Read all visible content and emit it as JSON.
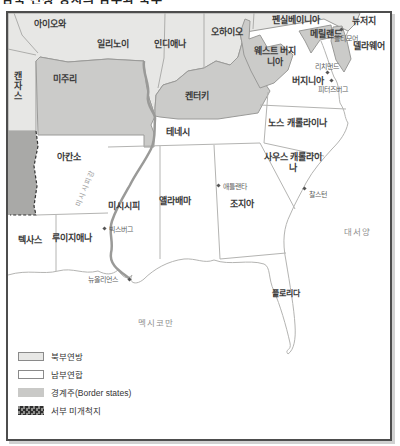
{
  "title_partial": "남북 전쟁 당시의 남부와 북부",
  "map": {
    "states": {
      "iowa": "아이오와",
      "illinois": "일리노이",
      "indiana": "인디애나",
      "ohio": "오하이오",
      "pennsylvania": "펜실베이니아",
      "new_jersey": "뉴저지",
      "kansas": "캔자스",
      "missouri": "미주리",
      "kentucky": "켄터키",
      "west_virginia": "웨스트 버지니아",
      "maryland": "메릴랜드",
      "delaware": "델라웨어",
      "virginia": "버지니아",
      "tennessee": "테네시",
      "north_carolina": "노스 캐롤라이나",
      "south_carolina": "사우스 캐롤라이나",
      "arkansas": "아칸소",
      "mississippi": "미시시피",
      "alabama": "앨라배마",
      "georgia": "조지아",
      "texas": "텍사스",
      "louisiana": "루이지애나",
      "florida": "플로리다"
    },
    "cities": {
      "baltimore": "볼티모어",
      "richmond": "리치먼드",
      "petersburg": "피터즈버그",
      "atlanta": "애틀랜타",
      "charleston": "찰스턴",
      "vicksburg": "빅스버그",
      "new_orleans": "뉴올리언스"
    },
    "water": {
      "atlantic": "대서양",
      "gulf_of_mexico": "멕시코만",
      "mississippi_river": "미시시피강"
    }
  },
  "legend": {
    "items": [
      {
        "label": "북부연방",
        "swatch": "union"
      },
      {
        "label": "남부연합",
        "swatch": "confederacy"
      },
      {
        "label": "경계주(Border states)",
        "swatch": "border-states"
      },
      {
        "label": "서부 미개척지",
        "swatch": "western-frontier"
      }
    ]
  },
  "colors": {
    "union": "#e7e7e5",
    "border_states": "#cbcbc9",
    "confederacy": "#ffffff",
    "western_frontier": "#a9a9a7",
    "boundary_line": "#b4b4b2",
    "river": "#9a9a98"
  }
}
